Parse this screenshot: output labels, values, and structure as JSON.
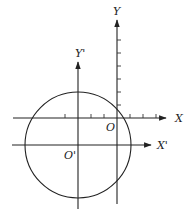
{
  "diagram": {
    "type": "coordinate-translation",
    "colors": {
      "stroke": "#222222",
      "background": "#ffffff"
    },
    "axes": {
      "original": {
        "origin_label": "O",
        "x_label": "X",
        "y_label": "Y",
        "origin_px": [
          117,
          118
        ],
        "tick_spacing_px": 13,
        "x_ticks_px": [
          65,
          91,
          104,
          130,
          143,
          156
        ],
        "y_ticks_px": [
          40,
          53,
          66,
          79,
          92,
          105
        ]
      },
      "translated": {
        "origin_label": "O'",
        "x_label": "X'",
        "y_label": "Y'",
        "origin_px": [
          78,
          145
        ]
      }
    },
    "circle": {
      "center_label": "O'",
      "center_px": [
        78,
        145
      ],
      "radius_px": 53
    }
  }
}
